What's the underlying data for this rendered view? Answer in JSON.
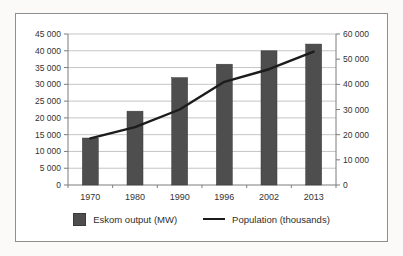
{
  "chart_data": {
    "type": "bar",
    "title": "",
    "categories": [
      "1970",
      "1980",
      "1990",
      "1996",
      "2002",
      "2013"
    ],
    "series": [
      {
        "name": "Eskom output (MW)",
        "type": "bar",
        "axis": "left",
        "values": [
          14000,
          22000,
          32000,
          36000,
          40000,
          42000
        ]
      },
      {
        "name": "Population (thousands)",
        "type": "line",
        "axis": "right",
        "values": [
          18500,
          23000,
          30000,
          41000,
          46000,
          53000
        ]
      }
    ],
    "left_axis": {
      "min": 0,
      "max": 45000,
      "step": 5000,
      "tick_labels": [
        "45 000",
        "40 000",
        "35 000",
        "30 000",
        "25 000",
        "20 000",
        "15 000",
        "10 000",
        "5 000",
        "0"
      ]
    },
    "right_axis": {
      "min": 0,
      "max": 60000,
      "step": 10000,
      "tick_labels": [
        "60 000",
        "50 000",
        "40 000",
        "30 000",
        "20 000",
        "10 000",
        "0"
      ]
    },
    "grid": true,
    "legend_position": "bottom"
  },
  "colors": {
    "bar": "#4e4e4e",
    "bar_edge": "#3a3a3a",
    "line": "#1c1c1c",
    "grid": "#b6b6b6",
    "axis": "#7d7d7d",
    "text": "#333333",
    "frame_border": "#8f8f8f",
    "chart_background": "#ffffff",
    "page_background": "#fbfaf8"
  }
}
